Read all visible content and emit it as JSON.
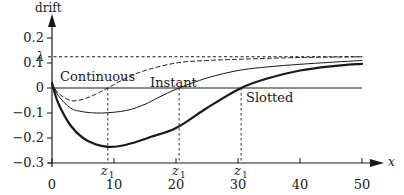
{
  "chart_data": {
    "type": "line",
    "title": "",
    "xlabel": "x",
    "ylabel": "drift",
    "xlim": [
      0,
      50
    ],
    "ylim": [
      -0.3,
      0.2
    ],
    "grid": false,
    "x_ticks": [
      0,
      10,
      20,
      30,
      40,
      50
    ],
    "y_ticks": [
      {
        "value": 0.2,
        "label": "0.2"
      },
      {
        "value": 0.1,
        "label": "0.1"
      },
      {
        "value": 0,
        "label": "0"
      },
      {
        "value": -0.1,
        "label": "−0.1"
      },
      {
        "value": -0.2,
        "label": "−0.2"
      },
      {
        "value": -0.3,
        "label": "−0.3"
      }
    ],
    "reference_lines": {
      "lambda": {
        "label": "λ",
        "value": 0.125,
        "style": "dashed"
      },
      "zero": {
        "value": 0,
        "style": "solid"
      }
    },
    "annotations": [
      {
        "label": "z1",
        "x": 9,
        "series": "Continuous"
      },
      {
        "label": "z1",
        "x": 20.5,
        "series": "Instant"
      },
      {
        "label": "z1",
        "x": 30.5,
        "series": "Slotted"
      }
    ],
    "series": [
      {
        "name": "Continuous",
        "style": "dashed",
        "x": [
          0,
          1,
          3,
          5,
          7,
          9,
          12,
          15,
          20,
          25,
          30,
          40,
          50
        ],
        "values": [
          0.02,
          -0.02,
          -0.05,
          -0.045,
          -0.025,
          0.0,
          0.04,
          0.07,
          0.1,
          0.11,
          0.115,
          0.122,
          0.125
        ]
      },
      {
        "name": "Instant",
        "style": "thin-solid",
        "x": [
          0,
          1,
          3,
          5,
          8,
          12,
          15,
          17,
          20.5,
          25,
          30,
          35,
          40,
          45,
          50
        ],
        "values": [
          0.02,
          -0.03,
          -0.08,
          -0.095,
          -0.1,
          -0.09,
          -0.065,
          -0.04,
          0.0,
          0.04,
          0.07,
          0.085,
          0.095,
          0.103,
          0.11
        ]
      },
      {
        "name": "Slotted",
        "style": "thick-solid",
        "x": [
          0,
          1,
          3,
          5,
          7,
          9,
          11,
          13,
          16,
          20,
          25,
          30.5,
          35,
          40,
          45,
          50
        ],
        "values": [
          0.02,
          -0.06,
          -0.15,
          -0.2,
          -0.225,
          -0.235,
          -0.232,
          -0.22,
          -0.195,
          -0.16,
          -0.08,
          0.0,
          0.04,
          0.07,
          0.087,
          0.097
        ]
      }
    ]
  },
  "labels": {
    "y_axis_title": "drift",
    "x_axis_title": "x",
    "lambda": "λ",
    "z1": "z",
    "z1_sub": "1",
    "continuous": "Continuous",
    "instant": "Instant",
    "slotted": "Slotted"
  }
}
